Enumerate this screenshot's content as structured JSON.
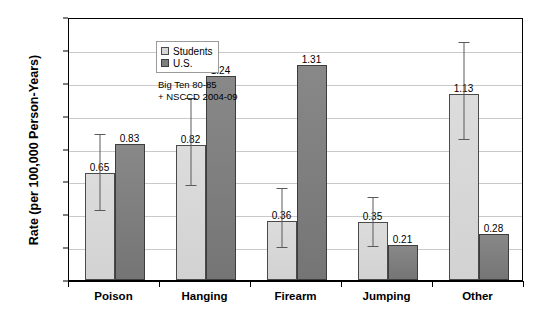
{
  "chart_data": {
    "type": "bar",
    "title": "",
    "xlabel": "",
    "ylabel": "Rate (per 100,000 Person-Years)",
    "ylim": [
      0.0,
      1.6
    ],
    "ytick_step": 0.2,
    "yticks": [
      "0.00",
      "0.20",
      "0.40",
      "0.60",
      "0.80",
      "1.00",
      "1.20",
      "1.40",
      "1.60"
    ],
    "grid": true,
    "legend_position": "top-left",
    "categories": [
      "Poison",
      "Hanging",
      "Firearm",
      "Jumping",
      "Other"
    ],
    "series": [
      {
        "name": "Students",
        "color": "#d6d6d6",
        "values": [
          0.65,
          0.82,
          0.36,
          0.35,
          1.13
        ],
        "labels": [
          "0.65",
          "0.82",
          "0.36",
          "0.35",
          "1.13"
        ],
        "error_low": [
          0.44,
          0.59,
          0.21,
          0.22,
          0.87
        ],
        "error_high": [
          0.9,
          1.12,
          0.57,
          0.52,
          1.46
        ]
      },
      {
        "name": "U.S.",
        "color": "#7e7e7e",
        "values": [
          0.83,
          1.24,
          1.31,
          0.21,
          0.28
        ],
        "labels": [
          "0.83",
          "1.24",
          "1.31",
          "0.21",
          "0.28"
        ],
        "error_low": [
          null,
          null,
          null,
          null,
          null
        ],
        "error_high": [
          null,
          null,
          null,
          null,
          null
        ]
      }
    ],
    "annotations": [
      "Big Ten 80-85",
      "+ NSCCD 2004-09"
    ]
  },
  "legend": {
    "items": [
      {
        "label": "Students",
        "swatch": "students-swatch-icon"
      },
      {
        "label": "U.S.",
        "swatch": "us-swatch-icon"
      }
    ]
  }
}
